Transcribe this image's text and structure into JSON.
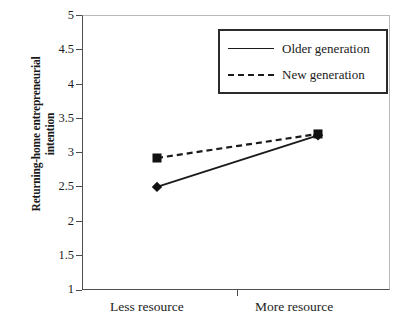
{
  "chart_data": {
    "type": "line",
    "title": "",
    "subtitle": "",
    "xlabel": "",
    "ylabel": "Returning-home entrepreneurial\nintention",
    "categories": [
      "Less resource",
      "More resource"
    ],
    "x": [
      0,
      1
    ],
    "ylim": [
      1,
      5
    ],
    "yticks": [
      "1",
      "1.5",
      "2",
      "2.5",
      "3",
      "3.5",
      "4",
      "4.5",
      "5"
    ],
    "ytick_values": [
      1,
      1.5,
      2,
      2.5,
      3,
      3.5,
      4,
      4.5,
      5
    ],
    "grid": false,
    "legend_position": "top-right",
    "series": [
      {
        "name": "Older generation",
        "values": [
          2.5,
          3.25
        ],
        "line_style": "solid",
        "marker": "diamond",
        "color": "#1a1a1a"
      },
      {
        "name": "New generation",
        "values": [
          2.92,
          3.27
        ],
        "line_style": "dashed",
        "marker": "square",
        "color": "#1a1a1a"
      }
    ],
    "annotations": []
  },
  "axes": {
    "y_title": "Returning-home entrepreneurial\nintention",
    "y_tick_labels": [
      "5",
      "4.5",
      "4",
      "3.5",
      "3",
      "2.5",
      "2",
      "1.5",
      "1"
    ],
    "x_tick_labels": [
      "Less resource",
      "More resource"
    ]
  },
  "legend": {
    "items": [
      {
        "label": "Older generation",
        "style": "solid"
      },
      {
        "label": "New generation",
        "style": "dashed"
      }
    ]
  },
  "colors": {
    "background": "#ffffff",
    "axis": "#4d4d4d",
    "frame_light": "#b8b8b8",
    "ink": "#1a1a1a"
  }
}
